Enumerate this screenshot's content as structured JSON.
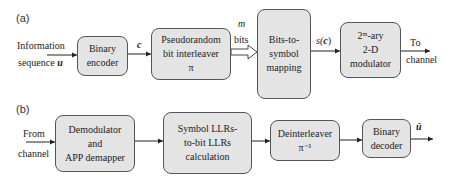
{
  "panel_a": {
    "label": "(a)",
    "input": {
      "line1": "Information",
      "line2": "sequence",
      "symbol": "u"
    },
    "boxes": {
      "encoder": {
        "line1": "Binary",
        "line2": "encoder"
      },
      "interleaver": {
        "line1": "Pseudorandom",
        "line2": "bit interleaver",
        "line3": "π"
      },
      "mapping": {
        "line1": "Bits-to-",
        "line2": "symbol",
        "line3": "mapping"
      },
      "modulator": {
        "line1": "2ᵐ-ary",
        "line2": "2-D",
        "line3": "modulator"
      }
    },
    "edges": {
      "c_label": "c",
      "m_label": "m",
      "bits_label": "bits",
      "s_label": "s(",
      "s_arg": "c",
      "s_close": ")",
      "out_line1": "To",
      "out_line2": "channel"
    }
  },
  "panel_b": {
    "label": "(b)",
    "input": {
      "line1": "From",
      "line2": "channel"
    },
    "boxes": {
      "demod": {
        "line1": "Demodulator",
        "line2": "and",
        "line3": "APP demapper"
      },
      "llr": {
        "line1": "Symbol LLRs-",
        "line2": "to-bit LLRs",
        "line3": "calculation"
      },
      "deinterleaver": {
        "line1": "Deinterleaver",
        "line2": "π⁻¹"
      },
      "decoder": {
        "line1": "Binary",
        "line2": "decoder"
      }
    },
    "output": {
      "symbol": "û"
    }
  }
}
